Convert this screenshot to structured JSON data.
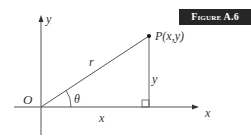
{
  "badge": {
    "label": "Figure A.6"
  },
  "diagram": {
    "axis_x_label": "x",
    "axis_y_label": "y",
    "origin_label": "O",
    "angle_label": "θ",
    "radius_label": "r",
    "point_label": "P(x,y)",
    "horizontal_leg_label": "x",
    "vertical_leg_label": "y",
    "colors": {
      "line": "#555555",
      "badge_bg": "#262626",
      "badge_text": "#ffffff"
    }
  }
}
